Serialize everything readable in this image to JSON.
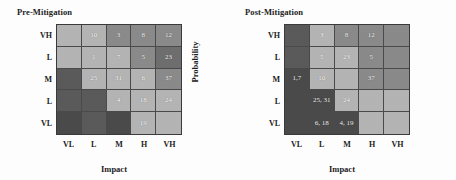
{
  "figure": {
    "panels": [
      {
        "title": "Pre-Mitigation",
        "ylabel": "Probability",
        "xlabel": "Impact"
      },
      {
        "title": "Post-Mitigation",
        "ylabel": "Probability",
        "xlabel": "Impact"
      }
    ]
  },
  "chart_data": [
    {
      "type": "heatmap",
      "title": "Pre-Mitigation",
      "xlabel": "Impact",
      "ylabel": "Probability",
      "categories_x": [
        "VL",
        "L",
        "M",
        "H",
        "VH"
      ],
      "categories_y": [
        "VH",
        "L",
        "M",
        "L",
        "VL"
      ],
      "grid": true,
      "legend": "none",
      "colors": {
        "green": "#9a9a9a",
        "yellow": "#b4b4b4",
        "orange": "#8a8a8a",
        "red": "#6e6e6e",
        "dark": "#5a5a5a",
        "darkest": "#4a4a4a"
      },
      "cells": [
        [
          {
            "label": "",
            "level": "yellow"
          },
          {
            "label": "10",
            "level": "yellow"
          },
          {
            "label": "3",
            "level": "orange"
          },
          {
            "label": "8",
            "level": "orange"
          },
          {
            "label": "12",
            "level": "orange"
          }
        ],
        [
          {
            "label": "",
            "level": "yellow"
          },
          {
            "label": "1",
            "level": "yellow"
          },
          {
            "label": "7",
            "level": "yellow"
          },
          {
            "label": "5",
            "level": "orange"
          },
          {
            "label": "23",
            "level": "red"
          }
        ],
        [
          {
            "label": "",
            "level": "dark"
          },
          {
            "label": "25",
            "level": "yellow"
          },
          {
            "label": "31",
            "level": "yellow"
          },
          {
            "label": "6",
            "level": "yellow"
          },
          {
            "label": "37",
            "level": "orange"
          }
        ],
        [
          {
            "label": "",
            "level": "dark"
          },
          {
            "label": "",
            "level": "dark"
          },
          {
            "label": "4",
            "level": "yellow"
          },
          {
            "label": "18",
            "level": "yellow"
          },
          {
            "label": "24",
            "level": "yellow"
          }
        ],
        [
          {
            "label": "",
            "level": "darkest"
          },
          {
            "label": "",
            "level": "dark"
          },
          {
            "label": "",
            "level": "darkest"
          },
          {
            "label": "19",
            "level": "yellow"
          },
          {
            "label": "",
            "level": "yellow"
          }
        ]
      ]
    },
    {
      "type": "heatmap",
      "title": "Post-Mitigation",
      "xlabel": "Impact",
      "ylabel": "Probability",
      "categories_x": [
        "VL",
        "L",
        "M",
        "H",
        "VH"
      ],
      "categories_y": [
        "VH",
        "L",
        "M",
        "L",
        "VL"
      ],
      "grid": true,
      "legend": "none",
      "colors": {
        "green": "#9a9a9a",
        "yellow": "#b4b4b4",
        "orange": "#8a8a8a",
        "red": "#6e6e6e",
        "dark": "#5a5a5a",
        "darkest": "#4a4a4a"
      },
      "cells": [
        [
          {
            "label": "",
            "level": "dark"
          },
          {
            "label": "3",
            "level": "yellow"
          },
          {
            "label": "8",
            "level": "orange"
          },
          {
            "label": "12",
            "level": "orange"
          },
          {
            "label": "",
            "level": "orange"
          }
        ],
        [
          {
            "label": "",
            "level": "dark"
          },
          {
            "label": "5",
            "level": "yellow"
          },
          {
            "label": "23",
            "level": "yellow"
          },
          {
            "label": "5",
            "level": "orange"
          },
          {
            "label": "",
            "level": "orange"
          }
        ],
        [
          {
            "label": "1,7",
            "level": "darkest"
          },
          {
            "label": "10",
            "level": "yellow"
          },
          {
            "label": "",
            "level": "yellow"
          },
          {
            "label": "37",
            "level": "orange"
          },
          {
            "label": "",
            "level": "orange"
          }
        ],
        [
          {
            "label": "",
            "level": "darkest"
          },
          {
            "label": "25, 31",
            "level": "darkest"
          },
          {
            "label": "24",
            "level": "yellow"
          },
          {
            "label": "",
            "level": "yellow"
          },
          {
            "label": "",
            "level": "yellow"
          }
        ],
        [
          {
            "label": "",
            "level": "darkest"
          },
          {
            "label": "6, 18",
            "level": "darkest"
          },
          {
            "label": "4, 19",
            "level": "darkest"
          },
          {
            "label": "",
            "level": "yellow"
          },
          {
            "label": "",
            "level": "yellow"
          }
        ]
      ]
    }
  ]
}
